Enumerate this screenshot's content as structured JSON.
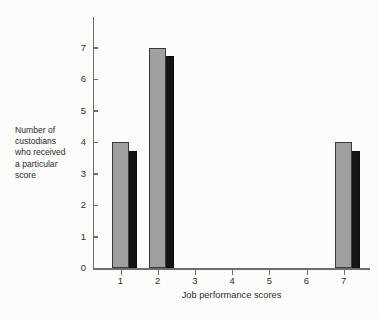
{
  "chart_data": {
    "type": "bar",
    "title": "",
    "subtitle": "",
    "xlabel": "Job performance scores",
    "ylabel": "Number of custodians who received a particular score",
    "categories": [
      "1",
      "2",
      "3",
      "4",
      "5",
      "6",
      "7"
    ],
    "values": [
      4,
      7,
      0,
      0,
      0,
      0,
      4
    ],
    "series": [
      {
        "name": "Number of custodians",
        "values": [
          4,
          7,
          0,
          0,
          0,
          0,
          4
        ]
      }
    ],
    "ylim": [
      0,
      7
    ],
    "xlim": [
      0,
      8
    ],
    "ytick_labels": [
      "0",
      "1",
      "2",
      "3",
      "4",
      "5",
      "6",
      "7"
    ],
    "ytick_values": [
      0,
      1,
      2,
      3,
      4,
      5,
      6,
      7
    ],
    "xtick_labels": [
      "1",
      "2",
      "3",
      "4",
      "5",
      "6",
      "7"
    ],
    "grid": false,
    "legend": false,
    "legend_position": "none",
    "bar_style": "3d-shadow",
    "colors": {
      "bar_face": "#9fa0a0",
      "bar_shadow": "#141414",
      "bar_outline": "#3b3b3b",
      "axis": "#6e6e6e",
      "text": "#2b2b2b",
      "background": "#fcfcfb"
    },
    "annotations": []
  },
  "axis": {
    "y_title_lines": [
      "Number of",
      "custodians",
      "who received",
      "a particular",
      "score"
    ],
    "x_title": "Job performance scores"
  }
}
